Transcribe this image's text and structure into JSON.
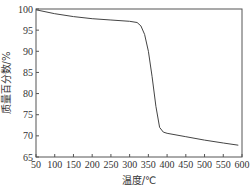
{
  "chart_data": {
    "type": "line",
    "title": "",
    "xlabel": "温度/℃",
    "ylabel": "质量百分数/%",
    "xlim": [
      50,
      600
    ],
    "ylim": [
      65,
      100
    ],
    "xticks": [
      50,
      100,
      150,
      200,
      250,
      300,
      350,
      400,
      450,
      500,
      550,
      600
    ],
    "yticks": [
      65,
      70,
      75,
      80,
      85,
      90,
      95,
      100
    ],
    "grid": false,
    "legend": null,
    "series": [
      {
        "name": "TG",
        "x": [
          50,
          100,
          150,
          200,
          250,
          300,
          320,
          330,
          340,
          350,
          360,
          370,
          380,
          390,
          400,
          450,
          500,
          550,
          590
        ],
        "y": [
          99.8,
          98.9,
          98.2,
          97.7,
          97.4,
          97.1,
          96.8,
          96.0,
          94.0,
          90.0,
          84.0,
          77.0,
          72.0,
          70.9,
          70.6,
          69.8,
          69.0,
          68.3,
          67.8
        ]
      }
    ]
  }
}
